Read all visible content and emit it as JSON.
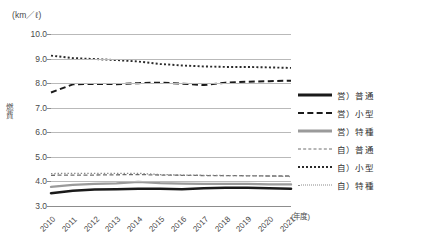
{
  "chart_data": {
    "type": "line",
    "title": "",
    "unit_caption": "(km／ℓ)",
    "ylabel": "燃費",
    "xlabel": "(年度)",
    "categories": [
      "2010",
      "2011",
      "2012",
      "2013",
      "2014",
      "2015",
      "2016",
      "2017",
      "2018",
      "2019",
      "2020",
      "2021"
    ],
    "ylim": [
      3.0,
      10.0
    ],
    "yticks": [
      "3.0",
      "4.0",
      "5.0",
      "6.0",
      "7.0",
      "8.0",
      "9.0",
      "10.0"
    ],
    "grid": true,
    "legend_position": "right",
    "series": [
      {
        "name": "営）普通",
        "style": "solid-thick",
        "color": "#1a1a1a",
        "values": [
          3.52,
          3.62,
          3.67,
          3.68,
          3.7,
          3.7,
          3.68,
          3.72,
          3.74,
          3.74,
          3.72,
          3.7
        ]
      },
      {
        "name": "営）小型",
        "style": "dash-thick",
        "color": "#1a1a1a",
        "values": [
          7.62,
          7.95,
          7.97,
          7.96,
          8.0,
          8.02,
          7.98,
          7.92,
          8.02,
          8.06,
          8.08,
          8.1
        ]
      },
      {
        "name": "営）特種",
        "style": "solid-gray",
        "color": "#9a9a9a",
        "values": [
          3.78,
          3.86,
          3.9,
          3.92,
          3.98,
          3.93,
          3.91,
          3.9,
          3.9,
          3.9,
          3.88,
          3.88
        ]
      },
      {
        "name": "自）普通",
        "style": "dash-thin",
        "color": "#6e6e6e",
        "values": [
          4.25,
          4.26,
          4.26,
          4.27,
          4.28,
          4.26,
          4.25,
          4.24,
          4.24,
          4.23,
          4.22,
          4.22
        ]
      },
      {
        "name": "自）小型",
        "style": "dot-a",
        "color": "#2a2a2a",
        "values": [
          9.12,
          9.02,
          8.98,
          8.94,
          8.88,
          8.78,
          8.72,
          8.68,
          8.66,
          8.66,
          8.64,
          8.62
        ]
      },
      {
        "name": "自）特種",
        "style": "dot-b",
        "color": "#8a8a8a",
        "values": [
          4.32,
          4.33,
          4.33,
          4.33,
          4.33,
          4.28,
          4.26,
          4.25,
          4.24,
          4.24,
          4.22,
          4.2
        ]
      }
    ]
  },
  "legend": {
    "items": [
      {
        "label": "営）普通",
        "swatch": "sw-solid-thick"
      },
      {
        "label": "営）小型",
        "swatch": "sw-dash-thick"
      },
      {
        "label": "営）特種",
        "swatch": "sw-solid-gray"
      },
      {
        "label": "自）普通",
        "swatch": "sw-dash-thin"
      },
      {
        "label": "自）小型",
        "swatch": "sw-dot-a"
      },
      {
        "label": "自）特種",
        "swatch": "sw-dot-b"
      }
    ]
  }
}
